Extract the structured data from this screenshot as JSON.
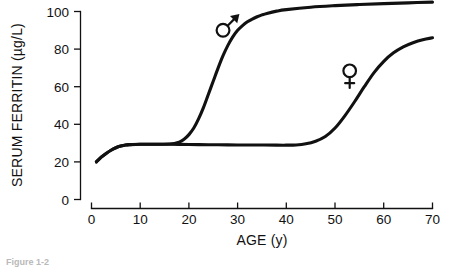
{
  "figure": {
    "caption_fragment": "Figure 1-2"
  },
  "chart_data": {
    "type": "line",
    "title": "",
    "xlabel": "AGE (y)",
    "ylabel": "SERUM FERRITIN (µg/L)",
    "xlim": [
      0,
      70
    ],
    "ylim": [
      0,
      108
    ],
    "xticks": [
      0,
      10,
      20,
      30,
      40,
      50,
      60,
      70
    ],
    "yticks": [
      0,
      20,
      40,
      60,
      80,
      100
    ],
    "xtick_labels": [
      "0",
      "10",
      "20",
      "30",
      "40",
      "50",
      "60",
      "70"
    ],
    "ytick_labels": [
      "0",
      "20",
      "40",
      "60",
      "80",
      "100"
    ],
    "grid": false,
    "legend": "inline-symbols",
    "series": [
      {
        "name": "male",
        "symbol": "♂",
        "symbol_label": "male-symbol",
        "symbol_x": 27,
        "symbol_y": 90,
        "x": [
          1,
          2,
          3,
          4,
          5,
          6,
          7,
          8,
          10,
          12,
          14,
          16,
          17,
          18,
          19,
          20,
          21,
          22,
          23,
          24,
          25,
          26,
          27,
          28,
          29,
          30,
          31,
          32,
          33,
          34,
          35,
          36,
          38,
          40,
          45,
          50,
          55,
          60,
          65,
          70
        ],
        "y": [
          20,
          22.5,
          24.5,
          26.2,
          27.5,
          28.4,
          29,
          29.2,
          29.4,
          29.4,
          29.4,
          29.5,
          29.8,
          30.5,
          32,
          34.5,
          38,
          43,
          49,
          56,
          63,
          70,
          76.5,
          82,
          86.5,
          90,
          92.5,
          94.5,
          96,
          97.2,
          98.2,
          99,
          100.2,
          101,
          102.3,
          103.1,
          103.7,
          104.2,
          104.6,
          105
        ]
      },
      {
        "name": "female",
        "symbol": "♀",
        "symbol_label": "female-symbol",
        "symbol_x": 53,
        "symbol_y": 66,
        "x": [
          1,
          2,
          3,
          4,
          5,
          6,
          7,
          8,
          10,
          14,
          18,
          22,
          26,
          30,
          34,
          38,
          40,
          42,
          44,
          46,
          48,
          50,
          52,
          54,
          56,
          58,
          60,
          62,
          64,
          66,
          68,
          70
        ],
        "y": [
          20,
          22.5,
          24.5,
          26.2,
          27.5,
          28.4,
          29,
          29.2,
          29.4,
          29.4,
          29.3,
          29.2,
          29.1,
          29,
          29,
          28.9,
          28.9,
          29,
          29.6,
          31,
          33.5,
          38,
          44.5,
          52,
          60,
          67.5,
          73.5,
          78,
          81.2,
          83.4,
          85,
          86
        ]
      }
    ]
  }
}
